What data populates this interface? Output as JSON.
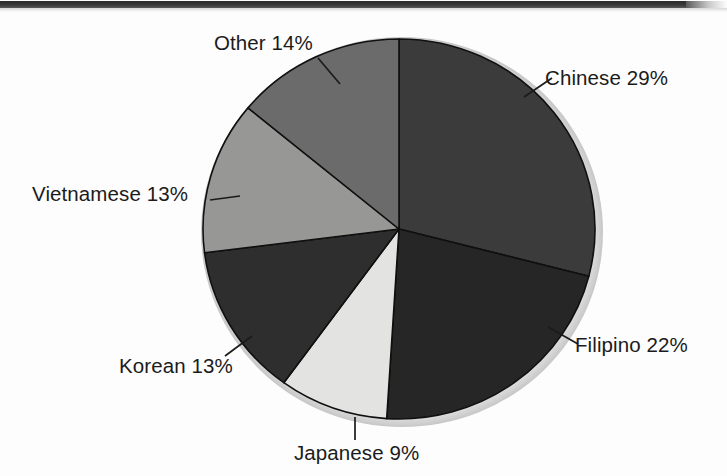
{
  "page": {
    "background_color": "#fdfdfd",
    "width": 727,
    "height": 476,
    "artifact_bar_color": "#2c2c2c"
  },
  "chart_data": {
    "type": "pie",
    "title": "",
    "subtitle": "",
    "xlabel": "",
    "ylabel": "",
    "grid": false,
    "legend_position": "none",
    "label_style": "outside-with-leader-lines",
    "start_angle_deg": 0,
    "direction": "clockwise",
    "center": {
      "x": 399,
      "y": 229
    },
    "radius_x": 196,
    "radius_y": 190,
    "total_percent": 100,
    "categories": [
      "Chinese",
      "Filipino",
      "Japanese",
      "Korean",
      "Vietnamese",
      "Other"
    ],
    "values": [
      29,
      22,
      9,
      13,
      13,
      14
    ],
    "slices": [
      {
        "name": "Chinese",
        "value": 29,
        "label": "Chinese 29%",
        "color": "#3b3b3c",
        "start_deg": 0,
        "end_deg": 104.4,
        "leader_from": {
          "x": 524,
          "y": 97
        },
        "leader_to": {
          "x": 552,
          "y": 78
        }
      },
      {
        "name": "Filipino",
        "value": 22,
        "label": "Filipino 22%",
        "color": "#262627",
        "start_deg": 104.4,
        "end_deg": 183.6,
        "leader_from": {
          "x": 548,
          "y": 327
        },
        "leader_to": {
          "x": 578,
          "y": 344
        }
      },
      {
        "name": "Japanese",
        "value": 9,
        "label": "Japanese 9%",
        "color": "#e3e3e1",
        "start_deg": 183.6,
        "end_deg": 216.0,
        "leader_from": {
          "x": 355,
          "y": 417
        },
        "leader_to": {
          "x": 355,
          "y": 440
        }
      },
      {
        "name": "Korean",
        "value": 13,
        "label": "Korean 13%",
        "color": "#2e2e2f",
        "start_deg": 216.0,
        "end_deg": 262.8,
        "leader_from": {
          "x": 252,
          "y": 336
        },
        "leader_to": {
          "x": 225,
          "y": 356
        }
      },
      {
        "name": "Vietnamese",
        "value": 13,
        "label": "Vietnamese 13%",
        "color": "#979796",
        "start_deg": 262.8,
        "end_deg": 309.6,
        "leader_from": {
          "x": 210,
          "y": 200
        },
        "leader_to": {
          "x": 240,
          "y": 196
        }
      },
      {
        "name": "Other",
        "value": 14,
        "label": "Other 14%",
        "color": "#6b6b6b",
        "start_deg": 309.6,
        "end_deg": 360.0,
        "leader_from": {
          "x": 318,
          "y": 58
        },
        "leader_to": {
          "x": 340,
          "y": 84
        }
      }
    ],
    "stroke_color": "#101010",
    "stroke_width": 1.6
  }
}
